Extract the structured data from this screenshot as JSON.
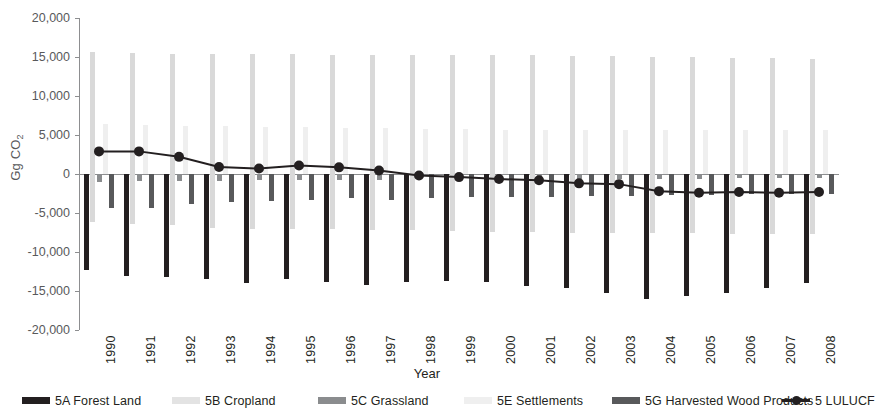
{
  "chart_data": {
    "type": "bar",
    "title": "",
    "xlabel": "Year",
    "ylabel": "Gg CO2",
    "ylabel_base": "Gg CO",
    "ylabel_sub": "2",
    "ylim": [
      -20000,
      20000
    ],
    "ytick_labels": [
      "20,000",
      "15,000",
      "10,000",
      "5,000",
      "0",
      "-5,000",
      "-10,000",
      "-15,000",
      "-20,000"
    ],
    "ytick_values": [
      20000,
      15000,
      10000,
      5000,
      0,
      -5000,
      -10000,
      -15000,
      -20000
    ],
    "grid": false,
    "legend_position": "bottom",
    "categories": [
      "1990",
      "1991",
      "1992",
      "1993",
      "1994",
      "1995",
      "1996",
      "1997",
      "1998",
      "1999",
      "2000",
      "2001",
      "2002",
      "2003",
      "2004",
      "2005",
      "2006",
      "2007",
      "2008"
    ],
    "series": [
      {
        "name": "5A Forest Land",
        "key": "forest_land",
        "color": "#231f20",
        "type": "bar",
        "values": [
          -12300,
          -13100,
          -13200,
          -13500,
          -14000,
          -13500,
          -13900,
          -14200,
          -13900,
          -13700,
          -13900,
          -14300,
          -14600,
          -15200,
          -16000,
          -15600,
          -15300,
          -14600,
          -14000
        ]
      },
      {
        "name": "5B Cropland",
        "key": "cropland",
        "color": "#d9d9d9",
        "type": "bar",
        "values": [
          15600,
          15500,
          15400,
          15400,
          15400,
          15400,
          15300,
          15300,
          15300,
          15300,
          15200,
          15200,
          15100,
          15100,
          15000,
          15000,
          14900,
          14900,
          14800
        ],
        "negative_values": [
          -6100,
          -6400,
          -6600,
          -6900,
          -7100,
          -7100,
          -7100,
          -7200,
          -7200,
          -7300,
          -7400,
          -7400,
          -7500,
          -7500,
          -7600,
          -7600,
          -7700,
          -7700,
          -7700
        ]
      },
      {
        "name": "5C Grassland",
        "key": "grassland",
        "color": "#8a8c8e",
        "type": "bar",
        "values": [
          -1000,
          -900,
          -900,
          -900,
          -800,
          -800,
          -800,
          -800,
          -700,
          -700,
          -700,
          -700,
          -600,
          -600,
          -600,
          -600,
          -500,
          -500,
          -500
        ]
      },
      {
        "name": "5E Settlements",
        "key": "settlements",
        "color": "#efefef",
        "type": "bar",
        "values": [
          6400,
          6300,
          6200,
          6100,
          6000,
          6000,
          5900,
          5900,
          5800,
          5800,
          5700,
          5700,
          5700,
          5600,
          5600,
          5600,
          5600,
          5600,
          5600
        ]
      },
      {
        "name": "5G Harvested Wood Products",
        "key": "harvested_wood",
        "color": "#58595b",
        "type": "bar",
        "values": [
          -4400,
          -4300,
          -3900,
          -3600,
          -3500,
          -3300,
          -3100,
          -3300,
          -3100,
          -3000,
          -2900,
          -2900,
          -2800,
          -2800,
          -2700,
          -2700,
          -2600,
          -2600,
          -2500
        ]
      },
      {
        "name": "5 LULUCF",
        "key": "lulucf",
        "color": "#231f20",
        "type": "line",
        "values": [
          2900,
          2900,
          2200,
          900,
          700,
          1100,
          850,
          450,
          -200,
          -400,
          -650,
          -800,
          -1200,
          -1300,
          -2200,
          -2400,
          -2300,
          -2400,
          -2300
        ]
      }
    ]
  },
  "legend": {
    "items": [
      {
        "label": "5A Forest Land",
        "marker": "bar-swatch",
        "color": "#231f20",
        "left": 22
      },
      {
        "label": "5B Cropland",
        "marker": "bar-swatch",
        "color": "#e3e3e3",
        "left": 172
      },
      {
        "label": "5C Grassland",
        "marker": "bar-swatch",
        "color": "#8a8c8e",
        "left": 318
      },
      {
        "label": "5E Settlements",
        "marker": "bar-swatch",
        "color": "#efefef",
        "left": 464
      },
      {
        "label": "5G Harvested Wood Products",
        "marker": "bar-swatch",
        "color": "#58595b",
        "left": 612
      },
      {
        "label": "5 LULUCF",
        "marker": "line-dot-swatch",
        "color": "#231f20",
        "left": 782
      }
    ]
  }
}
